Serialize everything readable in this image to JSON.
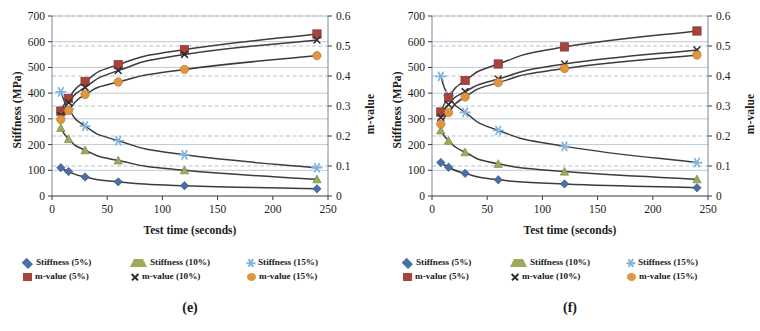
{
  "figure": {
    "panels": [
      {
        "label": "(e)",
        "axis": {
          "x_title": "Test time (seconds)",
          "y_left_title": "Stiffness (MPa)",
          "y_right_title": "m-value",
          "x_ticks": [
            "0",
            "50",
            "100",
            "150",
            "200",
            "250"
          ],
          "y_left_ticks": [
            "0",
            "100",
            "200",
            "300",
            "400",
            "500",
            "600",
            "700"
          ],
          "y_right_ticks": [
            "0",
            "0.1",
            "0.2",
            "0.3",
            "0.4",
            "0.5",
            "0.6"
          ]
        },
        "legend": [
          {
            "label": "Stiffness (5%)",
            "marker": "diamond",
            "color": "#4a6fa5"
          },
          {
            "label": "Stiffness (10%)",
            "marker": "triangle",
            "color": "#9aab5a"
          },
          {
            "label": "Stiffness (15%)",
            "marker": "star",
            "color": "#7fb4dd"
          },
          {
            "label": "m-value (5%)",
            "marker": "square",
            "color": "#a8423c"
          },
          {
            "label": "m-value (10%)",
            "marker": "cross",
            "color": "#2b2b2b"
          },
          {
            "label": "m-value (15%)",
            "marker": "circle",
            "color": "#e0963f"
          }
        ]
      },
      {
        "label": "(f)",
        "axis": {
          "x_title": "Test time (seconds)",
          "y_left_title": "Stiffness (MPa)",
          "y_right_title": "m-value",
          "x_ticks": [
            "0",
            "50",
            "100",
            "150",
            "200",
            "250"
          ],
          "y_left_ticks": [
            "0",
            "100",
            "200",
            "300",
            "400",
            "500",
            "600",
            "700"
          ],
          "y_right_ticks": [
            "0",
            "0.1",
            "0.2",
            "0.3",
            "0.4",
            "0.5",
            "0.6"
          ]
        },
        "legend": [
          {
            "label": "Stiffness (5%)",
            "marker": "diamond",
            "color": "#4a6fa5"
          },
          {
            "label": "Stiffness (10%)",
            "marker": "triangle",
            "color": "#9aab5a"
          },
          {
            "label": "Stiffness (15%)",
            "marker": "star",
            "color": "#7fb4dd"
          },
          {
            "label": "m-value (5%)",
            "marker": "square",
            "color": "#a8423c"
          },
          {
            "label": "m-value (10%)",
            "marker": "cross",
            "color": "#2b2b2b"
          },
          {
            "label": "m-value (15%)",
            "marker": "circle",
            "color": "#e0963f"
          }
        ]
      }
    ]
  },
  "chart_data": [
    {
      "type": "line",
      "title": "(e)",
      "xlabel": "Test time (seconds)",
      "ylabel": "Stiffness (MPa)",
      "y2label": "m-value",
      "xlim": [
        0,
        250
      ],
      "ylim": [
        0,
        700
      ],
      "y2lim": [
        0,
        0.6
      ],
      "grid": true,
      "legend_position": "below",
      "x": [
        8,
        15,
        30,
        60,
        120,
        240
      ],
      "series": [
        {
          "name": "Stiffness (5%)",
          "axis": "left",
          "marker": "diamond",
          "color": "#4a6fa5",
          "values": [
            110,
            95,
            74,
            55,
            40,
            28
          ]
        },
        {
          "name": "Stiffness (10%)",
          "axis": "left",
          "marker": "triangle",
          "color": "#9aab5a",
          "values": [
            265,
            222,
            178,
            138,
            100,
            65
          ]
        },
        {
          "name": "Stiffness (15%)",
          "axis": "left",
          "marker": "star",
          "color": "#7fb4dd",
          "values": [
            405,
            340,
            272,
            215,
            160,
            110
          ]
        },
        {
          "name": "m-value (5%)",
          "axis": "right",
          "marker": "square",
          "color": "#a8423c",
          "values": [
            0.283,
            0.325,
            0.382,
            0.438,
            0.488,
            0.54
          ]
        },
        {
          "name": "m-value (10%)",
          "axis": "right",
          "marker": "cross",
          "color": "#2b2b2b",
          "values": [
            0.268,
            0.312,
            0.362,
            0.418,
            0.472,
            0.52
          ]
        },
        {
          "name": "m-value (15%)",
          "axis": "right",
          "marker": "circle",
          "color": "#e0963f",
          "values": [
            0.255,
            0.285,
            0.338,
            0.38,
            0.422,
            0.468
          ]
        }
      ]
    },
    {
      "type": "line",
      "title": "(f)",
      "xlabel": "Test time (seconds)",
      "ylabel": "Stiffness (MPa)",
      "y2label": "m-value",
      "xlim": [
        0,
        250
      ],
      "ylim": [
        0,
        700
      ],
      "y2lim": [
        0,
        0.6
      ],
      "grid": true,
      "legend_position": "below",
      "x": [
        8,
        15,
        30,
        60,
        120,
        240
      ],
      "series": [
        {
          "name": "Stiffness (5%)",
          "axis": "left",
          "marker": "diamond",
          "color": "#4a6fa5",
          "values": [
            130,
            112,
            88,
            63,
            47,
            32
          ]
        },
        {
          "name": "Stiffness (10%)",
          "axis": "left",
          "marker": "triangle",
          "color": "#9aab5a",
          "values": [
            255,
            215,
            170,
            125,
            95,
            65
          ]
        },
        {
          "name": "Stiffness (15%)",
          "axis": "left",
          "marker": "star",
          "color": "#7fb4dd",
          "values": [
            465,
            390,
            325,
            255,
            193,
            130
          ]
        },
        {
          "name": "m-value (5%)",
          "axis": "right",
          "marker": "square",
          "color": "#a8423c",
          "values": [
            0.28,
            0.328,
            0.385,
            0.44,
            0.497,
            0.55
          ]
        },
        {
          "name": "m-value (10%)",
          "axis": "right",
          "marker": "cross",
          "color": "#2b2b2b",
          "values": [
            0.262,
            0.305,
            0.348,
            0.39,
            0.44,
            0.487
          ]
        },
        {
          "name": "m-value (15%)",
          "axis": "right",
          "marker": "circle",
          "color": "#e0963f",
          "values": [
            0.24,
            0.278,
            0.33,
            0.378,
            0.425,
            0.47
          ]
        }
      ]
    }
  ]
}
